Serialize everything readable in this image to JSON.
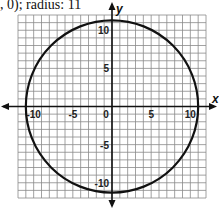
{
  "caption": ", 0); radius: 11",
  "chart_data": {
    "type": "line",
    "xlabel": "x",
    "ylabel": "y",
    "xlim": [
      -12,
      12
    ],
    "ylim": [
      -12,
      12
    ],
    "grid": true,
    "x_ticks": [
      "-10",
      "-5",
      "0",
      "5",
      "10"
    ],
    "y_ticks": [
      "10",
      "5",
      "-5",
      "-10"
    ],
    "series": [
      {
        "name": "circle",
        "center": [
          0,
          0
        ],
        "radius": 11
      }
    ]
  }
}
